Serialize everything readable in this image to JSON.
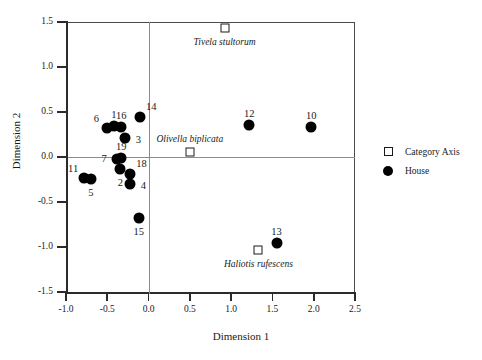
{
  "chart_data": {
    "type": "scatter",
    "title": "",
    "xlabel": "Dimension 1",
    "ylabel": "Dimension 2",
    "xlim": [
      -1.0,
      2.5
    ],
    "ylim": [
      -1.5,
      1.5
    ],
    "xticks": [
      "-1.0",
      "-0.5",
      "0.0",
      "0.5",
      "1.0",
      "1.5",
      "2.0",
      "2.5"
    ],
    "xtick_values": [
      -1.0,
      -0.5,
      0.0,
      0.5,
      1.0,
      1.5,
      2.0,
      2.5
    ],
    "yticks": [
      "1.5",
      "1.0",
      "0.5",
      "0.0",
      "-0.5",
      "-1.0",
      "-1.5"
    ],
    "ytick_values": [
      1.5,
      1.0,
      0.5,
      0.0,
      -0.5,
      -1.0,
      -1.5
    ],
    "grid": false,
    "zero_lines": true,
    "legend_position": "right",
    "series": [
      {
        "name": "House",
        "marker": "filled-circle",
        "color": "#000000",
        "points": [
          {
            "label": "6",
            "x": -0.5,
            "y": 0.32,
            "label_pos": "above-left"
          },
          {
            "label": "1",
            "x": -0.42,
            "y": 0.35,
            "label_pos": "above"
          },
          {
            "label": "16",
            "x": -0.33,
            "y": 0.33,
            "label_pos": "above"
          },
          {
            "label": "3",
            "x": -0.28,
            "y": 0.21,
            "label_pos": "right"
          },
          {
            "label": "14",
            "x": -0.1,
            "y": 0.44,
            "label_pos": "above-right"
          },
          {
            "label": "7",
            "x": -0.38,
            "y": -0.02,
            "label_pos": "left"
          },
          {
            "label": "19",
            "x": -0.33,
            "y": -0.01,
            "label_pos": "above"
          },
          {
            "label": "2",
            "x": -0.34,
            "y": -0.13,
            "label_pos": "below"
          },
          {
            "label": "11",
            "x": -0.78,
            "y": -0.23,
            "label_pos": "above-left"
          },
          {
            "label": "5",
            "x": -0.7,
            "y": -0.24,
            "label_pos": "below"
          },
          {
            "label": "18",
            "x": -0.22,
            "y": -0.19,
            "label_pos": "above-right"
          },
          {
            "label": "4",
            "x": -0.22,
            "y": -0.3,
            "label_pos": "right"
          },
          {
            "label": "15",
            "x": -0.12,
            "y": -0.68,
            "label_pos": "below"
          },
          {
            "label": "12",
            "x": 1.22,
            "y": 0.36,
            "label_pos": "above"
          },
          {
            "label": "10",
            "x": 1.97,
            "y": 0.33,
            "label_pos": "above"
          },
          {
            "label": "13",
            "x": 1.55,
            "y": -0.96,
            "label_pos": "above"
          }
        ]
      },
      {
        "name": "Category Axis",
        "marker": "open-square",
        "color": "#1a1a1a",
        "points": [
          {
            "label": "Tivela stultorum",
            "x": 0.92,
            "y": 1.43,
            "label_pos": "below"
          },
          {
            "label": "Olivella biplicata",
            "x": 0.5,
            "y": 0.06,
            "label_pos": "above"
          },
          {
            "label": "Haliotis rufescens",
            "x": 1.33,
            "y": -1.03,
            "label_pos": "below"
          }
        ]
      }
    ]
  },
  "legend": {
    "items": [
      {
        "key": "open-square",
        "label": "Category Axis"
      },
      {
        "key": "filled-circle",
        "label": "House"
      }
    ]
  }
}
